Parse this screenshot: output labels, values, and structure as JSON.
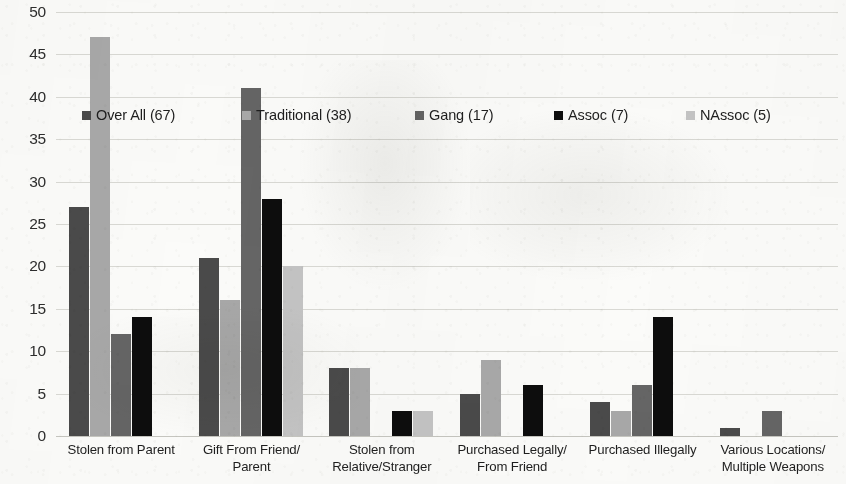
{
  "chart_data": {
    "type": "bar",
    "title": "",
    "subtitle": "",
    "xlabel": "",
    "ylabel": "",
    "ylim": [
      0,
      50
    ],
    "ytick_step": 5,
    "yticks": [
      50,
      45,
      40,
      35,
      30,
      25,
      20,
      15,
      10,
      5,
      0
    ],
    "grid": true,
    "legend_position": "inside-top-left",
    "categories": [
      "Stolen from Parent",
      "Gift From Friend/Parent",
      "Stolen from Relative/Stranger",
      "Purchased Legally/From Friend",
      "Purchased Illegally",
      "Various Locations/Multiple Weapons"
    ],
    "category_lines": [
      [
        "Stolen from Parent"
      ],
      [
        "Gift From Friend/",
        "Parent"
      ],
      [
        "Stolen from",
        "Relative/Stranger"
      ],
      [
        "Purchased Legally/",
        "From Friend"
      ],
      [
        "Purchased Illegally"
      ],
      [
        "Various Locations/",
        "Multiple Weapons"
      ]
    ],
    "series": [
      {
        "name": "Over All (67)",
        "color": "#4a4a4a",
        "values": [
          27,
          21,
          8,
          5,
          4,
          1
        ]
      },
      {
        "name": "Traditional (38)",
        "color": "#a8a8a8",
        "values": [
          47,
          16,
          8,
          9,
          3,
          0
        ]
      },
      {
        "name": "Gang (17)",
        "color": "#656565",
        "values": [
          12,
          41,
          0,
          0,
          6,
          3
        ]
      },
      {
        "name": "Assoc (7)",
        "color": "#0d0d0d",
        "values": [
          14,
          28,
          3,
          6,
          14,
          0
        ]
      },
      {
        "name": "NAssoc (5)",
        "color": "#c4c4c4",
        "values": [
          0,
          20,
          3,
          0,
          0,
          0
        ]
      }
    ]
  },
  "legend": {
    "items": [
      {
        "label": "Over All (67)",
        "color": "#4a4a4a"
      },
      {
        "label": "Traditional (38)",
        "color": "#a8a8a8"
      },
      {
        "label": "Gang (17)",
        "color": "#656565"
      },
      {
        "label": "Assoc (7)",
        "color": "#0d0d0d"
      },
      {
        "label": "NAssoc (5)",
        "color": "#c4c4c4"
      }
    ],
    "offsets_px": [
      0,
      160,
      333,
      472,
      604
    ]
  }
}
